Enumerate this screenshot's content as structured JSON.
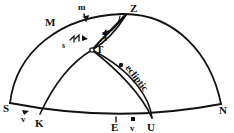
{
  "figure": {
    "background_color": "#ffffff",
    "ink_color": "#111111"
  },
  "labels": {
    "zenith": "Z",
    "meridian_point_M": "M",
    "arc_segment_m": "m",
    "arc_segment_t": "t",
    "arc_segment_s": "s",
    "intersection_T": "T",
    "south_point": "S",
    "north_point": "N",
    "horizon_point_K": "K",
    "horizon_point_E": "E",
    "horizon_point_U": "U",
    "vernal_marker_left": "v",
    "vernal_marker_bottom": "v",
    "ecliptic": "ecliptic"
  },
  "points": [
    {
      "name": "Z",
      "label": "Z",
      "x": 126,
      "y": 10
    },
    {
      "name": "M",
      "label": "M",
      "x": 50,
      "y": 22
    },
    {
      "name": "m",
      "label": "m",
      "x": 82,
      "y": 10
    },
    {
      "name": "t",
      "label": "t",
      "x": 105,
      "y": 36
    },
    {
      "name": "s",
      "label": "s",
      "x": 63,
      "y": 45
    },
    {
      "name": "T",
      "label": "T",
      "x": 94,
      "y": 44
    },
    {
      "name": "S",
      "label": "S",
      "x": 8,
      "y": 108
    },
    {
      "name": "N",
      "label": "N",
      "x": 222,
      "y": 110
    },
    {
      "name": "K",
      "label": "K",
      "x": 40,
      "y": 122
    },
    {
      "name": "E",
      "label": "E",
      "x": 115,
      "y": 127
    },
    {
      "name": "U",
      "label": "U",
      "x": 152,
      "y": 127
    },
    {
      "name": "v-left",
      "label": "v",
      "x": 24,
      "y": 119
    },
    {
      "name": "v-bottom",
      "label": "v",
      "x": 134,
      "y": 127
    }
  ],
  "arcs": [
    {
      "name": "horizon-arc",
      "from": "S",
      "to": "N",
      "stroke_width": 1.8
    },
    {
      "name": "meridian-dome-arc",
      "from": "S",
      "to": "N",
      "through": "Z",
      "stroke_width": 1.8
    },
    {
      "name": "ecliptic-arc",
      "from": "Z",
      "to": "U",
      "stroke_width": 1.6
    },
    {
      "name": "great-circle-K-Z",
      "from": "K",
      "to": "Z",
      "stroke_width": 1.6
    },
    {
      "name": "angle-wedge-at-Z",
      "from": "Z",
      "to": "T",
      "stroke_width": 1.2
    }
  ],
  "ticks": [
    {
      "name": "tick-m",
      "on": "meridian-dome-arc"
    },
    {
      "name": "tick-s",
      "on": "great-circle-K-Z"
    },
    {
      "name": "tick-t",
      "on": "ecliptic-arc"
    },
    {
      "name": "tick-v-left",
      "on": "horizon-arc"
    },
    {
      "name": "tick-E",
      "on": "horizon-arc"
    },
    {
      "name": "tick-v-bottom",
      "on": "horizon-arc"
    }
  ]
}
